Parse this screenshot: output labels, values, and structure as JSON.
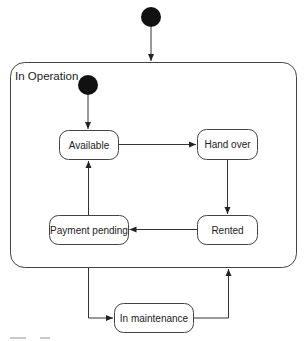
{
  "diagram": {
    "type": "uml-state-machine",
    "composite_state": {
      "label": "In Operation"
    },
    "states": [
      {
        "id": "available",
        "label": "Available"
      },
      {
        "id": "hand_over",
        "label": "Hand over"
      },
      {
        "id": "rented",
        "label": "Rented"
      },
      {
        "id": "payment_pending",
        "label": "Payment pending"
      },
      {
        "id": "in_maintenance",
        "label": "In maintenance"
      }
    ],
    "transitions": [
      {
        "from": "initial-outer",
        "to": "In Operation"
      },
      {
        "from": "initial-inner",
        "to": "Available"
      },
      {
        "from": "Available",
        "to": "Hand over"
      },
      {
        "from": "Hand over",
        "to": "Rented"
      },
      {
        "from": "Rented",
        "to": "Payment pending"
      },
      {
        "from": "Payment pending",
        "to": "Available"
      },
      {
        "from": "In Operation",
        "to": "In maintenance"
      },
      {
        "from": "In maintenance",
        "to": "In Operation"
      }
    ],
    "colors": {
      "stroke": "#333333",
      "fill": "#ffffff",
      "initial": "#111111"
    }
  }
}
